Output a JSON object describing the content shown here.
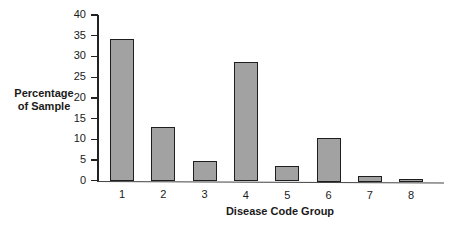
{
  "chart_data": {
    "type": "bar",
    "title": "",
    "xlabel": "Disease Code Group",
    "ylabel": "Percentage of Sample",
    "ylabel_lines": [
      "Percentage",
      "of Sample"
    ],
    "categories": [
      "1",
      "2",
      "3",
      "4",
      "5",
      "6",
      "7",
      "8"
    ],
    "values": [
      34.2,
      13.0,
      4.8,
      28.7,
      3.8,
      10.6,
      1.5,
      0.8
    ],
    "ylim": [
      0,
      40
    ],
    "yticks": [
      0,
      5,
      10,
      15,
      20,
      25,
      30,
      35,
      40
    ],
    "grid": false,
    "legend": null,
    "colors": {
      "bar_fill": "#a2a2a2",
      "bar_edge": "#1e1e1e",
      "axis": "#222222"
    }
  }
}
